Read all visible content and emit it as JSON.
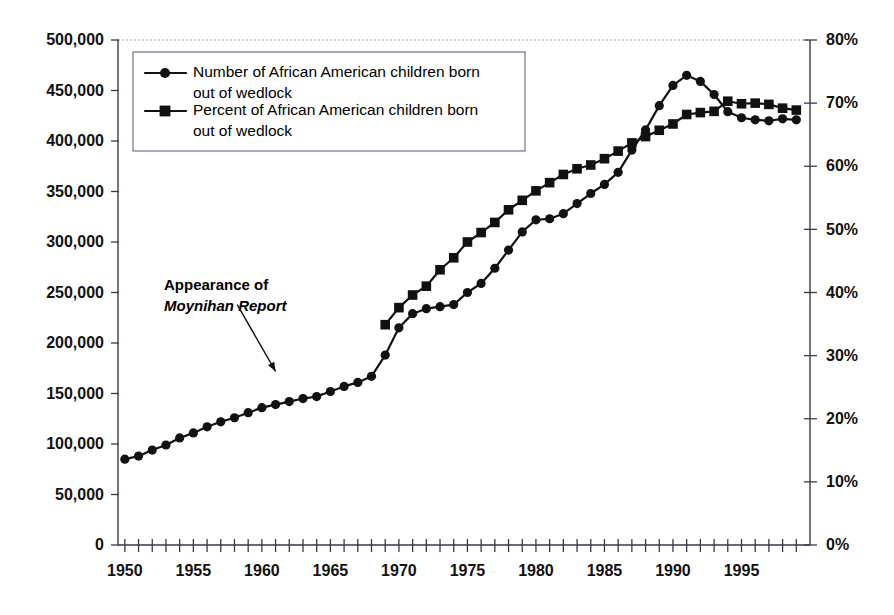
{
  "chart_data": {
    "type": "line",
    "title": "",
    "subtitle": "",
    "xlabel": "",
    "ylabel": "",
    "grid": false,
    "legend_position": "top-left-inside",
    "x": [
      1950,
      1951,
      1952,
      1953,
      1954,
      1955,
      1956,
      1957,
      1958,
      1959,
      1960,
      1961,
      1962,
      1963,
      1964,
      1965,
      1966,
      1967,
      1968,
      1969,
      1970,
      1971,
      1972,
      1973,
      1974,
      1975,
      1976,
      1977,
      1978,
      1979,
      1980,
      1981,
      1982,
      1983,
      1984,
      1985,
      1986,
      1987,
      1988,
      1989,
      1990,
      1991,
      1992,
      1993,
      1994,
      1995,
      1996,
      1997,
      1998,
      1999
    ],
    "xlim": [
      1949.5,
      2000.0
    ],
    "xticks_every": 1,
    "xtick_labels": [
      "1950",
      "1955",
      "1960",
      "1965",
      "1970",
      "1975",
      "1980",
      "1985",
      "1990",
      "1995"
    ],
    "xtick_label_values": [
      1950,
      1955,
      1960,
      1965,
      1970,
      1975,
      1980,
      1985,
      1990,
      1995
    ],
    "left_axis": {
      "label": "",
      "ylim": [
        0,
        500000
      ],
      "ticks": [
        0,
        50000,
        100000,
        150000,
        200000,
        250000,
        300000,
        350000,
        400000,
        450000,
        500000
      ],
      "tick_labels": [
        "0",
        "50,000",
        "100,000",
        "150,000",
        "200,000",
        "250,000",
        "300,000",
        "350,000",
        "400,000",
        "450,000",
        "500,000"
      ]
    },
    "right_axis": {
      "label": "",
      "ylim": [
        0,
        80
      ],
      "ticks": [
        0,
        10,
        20,
        30,
        40,
        50,
        60,
        70,
        80
      ],
      "tick_labels": [
        "0%",
        "10%",
        "20%",
        "30%",
        "40%",
        "50%",
        "60%",
        "70%",
        "80%"
      ]
    },
    "series": [
      {
        "name": "Number of African American children born out of wedlock",
        "legend_label_line1": "Number of African American children born",
        "legend_label_line2": "out of wedlock",
        "marker": "circle",
        "axis": "left",
        "color": "#111111",
        "x": [
          1950,
          1951,
          1952,
          1953,
          1954,
          1955,
          1956,
          1957,
          1958,
          1959,
          1960,
          1961,
          1962,
          1963,
          1964,
          1965,
          1966,
          1967,
          1968,
          1969,
          1970,
          1971,
          1972,
          1973,
          1974,
          1975,
          1976,
          1977,
          1978,
          1979,
          1980,
          1981,
          1982,
          1983,
          1984,
          1985,
          1986,
          1987,
          1988,
          1989,
          1990,
          1991,
          1992,
          1993,
          1994,
          1995,
          1996,
          1997,
          1998,
          1999
        ],
        "values": [
          85000,
          88000,
          94000,
          99000,
          106000,
          111000,
          117000,
          122000,
          126000,
          131000,
          136000,
          139000,
          142000,
          145000,
          147000,
          152000,
          157000,
          161000,
          167000,
          188000,
          215000,
          229000,
          234000,
          236000,
          238000,
          250000,
          259000,
          274000,
          292000,
          310000,
          322000,
          323000,
          328000,
          338000,
          348000,
          357000,
          369000,
          391000,
          411000,
          435000,
          455000,
          465000,
          459000,
          446000,
          429000,
          423000,
          421000,
          420000,
          422000,
          421000
        ]
      },
      {
        "name": "Percent of African American children born out of wedlock",
        "legend_label_line1": "Percent of African American children born",
        "legend_label_line2": "out of wedlock",
        "marker": "square",
        "axis": "right",
        "color": "#111111",
        "x": [
          1969,
          1970,
          1971,
          1972,
          1973,
          1974,
          1975,
          1976,
          1977,
          1978,
          1979,
          1980,
          1981,
          1982,
          1983,
          1984,
          1985,
          1986,
          1987,
          1988,
          1989,
          1990,
          1991,
          1992,
          1993,
          1994,
          1995,
          1996,
          1997,
          1998,
          1999
        ],
        "values": [
          34.9,
          37.6,
          39.6,
          41.0,
          43.6,
          45.5,
          48.0,
          49.5,
          51.1,
          53.1,
          54.6,
          56.1,
          57.4,
          58.7,
          59.6,
          60.2,
          61.2,
          62.4,
          63.7,
          64.7,
          65.7,
          66.7,
          68.2,
          68.5,
          68.7,
          70.3,
          69.9,
          70.0,
          69.8,
          69.2,
          68.9
        ]
      }
    ],
    "annotations": [
      {
        "name": "moynihan-report",
        "line1": "Appearance of",
        "line2": "Moynihan Report",
        "line2_style": "bold-italic",
        "arrow_from_x": 1958.2,
        "arrow_from_y": 238000,
        "arrow_to_x": 1961.0,
        "arrow_to_y": 172000
      }
    ]
  }
}
